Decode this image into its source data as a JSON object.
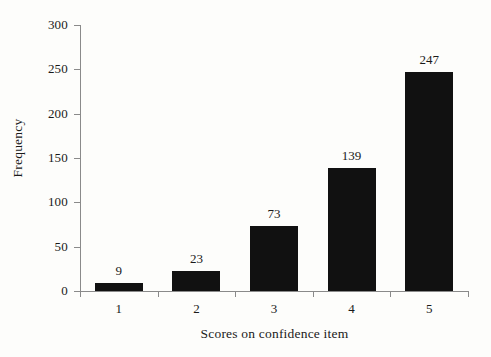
{
  "chart_data": {
    "type": "bar",
    "title": "",
    "xlabel": "Scores on confidence item",
    "ylabel": "Frequency",
    "categories": [
      "1",
      "2",
      "3",
      "4",
      "5"
    ],
    "values": [
      9,
      23,
      73,
      139,
      247
    ],
    "value_labels": [
      "9",
      "23",
      "73",
      "139",
      "247"
    ],
    "ylim": [
      0,
      300
    ],
    "ytick_labels": [
      "0",
      "50",
      "100",
      "150",
      "200",
      "250",
      "300"
    ],
    "ytick_values": [
      0,
      50,
      100,
      150,
      200,
      250,
      300
    ],
    "grid": false,
    "legend": null,
    "bar_color": "#111111",
    "axis_color": "#8a8a8a",
    "background_color": "#fdfdfb"
  }
}
